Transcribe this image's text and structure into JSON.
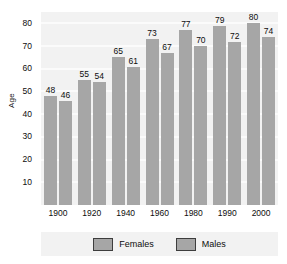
{
  "chart_data": {
    "type": "bar",
    "title": "",
    "xlabel": "",
    "ylabel": "Age",
    "categories": [
      "1900",
      "1920",
      "1940",
      "1960",
      "1980",
      "1990",
      "2000"
    ],
    "series": [
      {
        "name": "Females",
        "values": [
          48,
          55,
          65,
          73,
          77,
          79,
          80
        ],
        "color": "#a6a6a6"
      },
      {
        "name": "Males",
        "values": [
          46,
          54,
          61,
          67,
          70,
          72,
          74
        ],
        "color": "#a6a6a6"
      }
    ],
    "ylim": [
      0,
      85
    ],
    "yticks": [
      10,
      20,
      30,
      40,
      50,
      60,
      70,
      80
    ],
    "ytick_labels": [
      "10",
      "20",
      "30",
      "40",
      "50",
      "60",
      "70",
      "80"
    ],
    "grid": true,
    "grid_color": "#fbfbfb",
    "plot_background": "#f2f2f2",
    "legend_position": "bottom",
    "legend": [
      "Females",
      "Males"
    ]
  }
}
